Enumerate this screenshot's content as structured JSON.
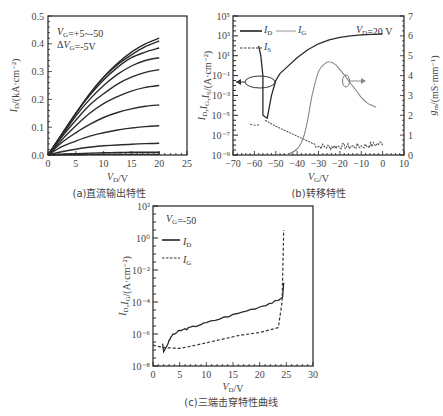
{
  "chart_data": [
    {
      "id": "a",
      "type": "line",
      "caption": "(a)直流输出特性",
      "title": "",
      "xlabel": "V_D/V",
      "ylabel": "I_D/(kA·cm⁻²)",
      "xlim": [
        0,
        25
      ],
      "ylim": [
        0,
        0.5
      ],
      "xticks": [
        "0",
        "5",
        "10",
        "15",
        "20",
        "25"
      ],
      "yticks": [
        "0.0",
        "0.1",
        "0.2",
        "0.3",
        "0.4",
        "0.5"
      ],
      "annotation": [
        "V_G=+5~-50",
        "ΔV_G=-5V"
      ],
      "x": [
        0,
        2.5,
        5,
        7.5,
        10,
        12.5,
        15,
        17.5,
        20
      ],
      "series": [
        {
          "name": "VG=-50",
          "values": [
            0,
            0.075,
            0.15,
            0.22,
            0.28,
            0.33,
            0.37,
            0.4,
            0.42
          ]
        },
        {
          "name": "VG=-45",
          "values": [
            0,
            0.075,
            0.15,
            0.22,
            0.28,
            0.325,
            0.36,
            0.39,
            0.41
          ]
        },
        {
          "name": "VG=-40",
          "values": [
            0,
            0.075,
            0.15,
            0.215,
            0.27,
            0.315,
            0.35,
            0.37,
            0.385
          ]
        },
        {
          "name": "VG=-35",
          "values": [
            0,
            0.07,
            0.14,
            0.2,
            0.25,
            0.29,
            0.32,
            0.34,
            0.35
          ]
        },
        {
          "name": "VG=-30",
          "values": [
            0,
            0.065,
            0.125,
            0.18,
            0.22,
            0.255,
            0.28,
            0.297,
            0.307
          ]
        },
        {
          "name": "VG=-25",
          "values": [
            0,
            0.055,
            0.105,
            0.15,
            0.185,
            0.21,
            0.23,
            0.243,
            0.25
          ]
        },
        {
          "name": "VG=-20",
          "values": [
            0,
            0.045,
            0.08,
            0.11,
            0.135,
            0.153,
            0.166,
            0.175,
            0.18
          ]
        },
        {
          "name": "VG=-15",
          "values": [
            0,
            0.03,
            0.05,
            0.068,
            0.08,
            0.09,
            0.097,
            0.102,
            0.105
          ]
        },
        {
          "name": "VG=-10",
          "values": [
            0,
            0.012,
            0.021,
            0.028,
            0.033,
            0.036,
            0.039,
            0.041,
            0.042
          ]
        },
        {
          "name": "VG=-5",
          "values": [
            0,
            0.003,
            0.005,
            0.007,
            0.008,
            0.009,
            0.01,
            0.01,
            0.01
          ]
        },
        {
          "name": "VG=0..+5",
          "values": [
            0,
            0.001,
            0.001,
            0.002,
            0.002,
            0.002,
            0.002,
            0.002,
            0.002
          ]
        }
      ]
    },
    {
      "id": "b",
      "type": "line",
      "caption": "(b)转移特性",
      "xlabel": "V_G/V",
      "ylabel": "I_D,I_G,I_S/(A·cm⁻²)",
      "y2label": "g_m/(mS·mm⁻¹)",
      "xlim": [
        -70,
        10
      ],
      "ylim_log10": [
        -9,
        5
      ],
      "y2lim": [
        0,
        7
      ],
      "xticks": [
        "-70",
        "-60",
        "-50",
        "-40",
        "-30",
        "-20",
        "-10",
        "0",
        "10"
      ],
      "yticks": [
        "10⁵",
        "10³",
        "10¹",
        "10⁻¹",
        "10⁻³",
        "10⁻⁵",
        "10⁻⁷",
        "10⁻⁹"
      ],
      "y2ticks": [
        "0",
        "1",
        "2",
        "3",
        "4",
        "5",
        "6",
        "7"
      ],
      "annotation": "V_D=20 V",
      "legend": [
        "I_D",
        "I_G",
        "I_S"
      ],
      "series": [
        {
          "name": "I_D",
          "axis": "left",
          "x": [
            -58,
            -57,
            -56,
            -56,
            -54,
            -52,
            -50,
            -48,
            -45,
            -40,
            -35,
            -30,
            -25,
            -20,
            -15,
            -10,
            -5,
            0
          ],
          "log10_values": [
            2.0,
            1.0,
            -1.0,
            -5.0,
            -5.3,
            -3.0,
            -1.5,
            -0.8,
            -0.2,
            0.8,
            1.6,
            2.2,
            2.6,
            2.85,
            3.0,
            3.1,
            3.15,
            3.2
          ]
        },
        {
          "name": "I_G / I_S",
          "axis": "left",
          "x": [
            -55,
            -50,
            -45,
            -40,
            -35,
            -30,
            -25,
            -20,
            -15,
            -10,
            -5,
            0
          ],
          "log10_values": [
            -5.5,
            -6.1,
            -6.6,
            -7.1,
            -7.6,
            -8.1,
            -8.2,
            -8.1,
            -8.15,
            -8.1,
            -8.0,
            -7.8
          ]
        },
        {
          "name": "g_m",
          "axis": "right",
          "x": [
            -45,
            -40,
            -37,
            -35,
            -33,
            -30,
            -27,
            -25,
            -22,
            -20,
            -17,
            -15,
            -12,
            -10,
            -7,
            -5,
            -3
          ],
          "values": [
            0,
            0.3,
            0.9,
            1.8,
            3.0,
            4.2,
            4.6,
            4.7,
            4.55,
            4.3,
            3.9,
            3.6,
            3.2,
            2.9,
            2.6,
            2.5,
            2.4
          ]
        }
      ]
    },
    {
      "id": "c",
      "type": "line",
      "caption": "(c)三端击穿特性曲线",
      "xlabel": "V_D/V",
      "ylabel": "I_D,I_G/(A·cm⁻²)",
      "xlim": [
        0,
        30
      ],
      "ylim_log10": [
        -8,
        2
      ],
      "xticks": [
        "0",
        "5",
        "10",
        "15",
        "20",
        "25",
        "30"
      ],
      "yticks": [
        "10²",
        "10⁰",
        "10⁻²",
        "10⁻⁴",
        "10⁻⁶",
        "10⁻⁸"
      ],
      "annotation": "V_G=-50",
      "legend": [
        "I_D",
        "I_G"
      ],
      "series": [
        {
          "name": "I_D",
          "x": [
            1.8,
            2.0,
            2.5,
            3.5,
            5,
            7,
            10,
            15,
            20,
            23.5,
            24.3,
            24.5
          ],
          "log10_values": [
            -6.6,
            -7.1,
            -6.8,
            -6.1,
            -5.8,
            -5.6,
            -5.3,
            -4.8,
            -4.3,
            -3.9,
            -3.7,
            -2.8
          ]
        },
        {
          "name": "I_G",
          "x": [
            0,
            2,
            5,
            8,
            12,
            16,
            20,
            23.5,
            24.2,
            24.5
          ],
          "log10_values": [
            -6.7,
            -6.85,
            -6.9,
            -6.7,
            -6.4,
            -6.1,
            -5.9,
            -5.6,
            -4.0,
            0.5
          ]
        }
      ]
    }
  ]
}
